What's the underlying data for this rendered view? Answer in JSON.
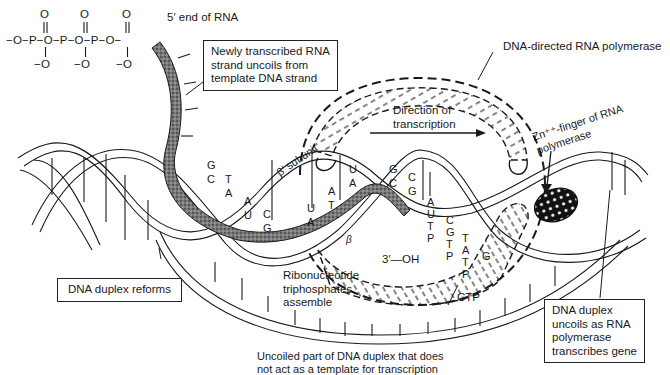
{
  "phosphate_chain": {
    "top_oxygens": [
      "O",
      "O",
      "O"
    ],
    "main_line": "−O−P−O−P−O−P−O−",
    "bottom_oxygens": [
      "−O",
      "−O",
      "−O"
    ]
  },
  "labels": {
    "five_prime_end": "5′ end of RNA",
    "newly_transcribed": [
      "Newly transcribed RNA",
      "strand uncoils from",
      "template DNA strand"
    ],
    "polymerase": "DNA-directed RNA polymerase",
    "direction": [
      "Direction of",
      "transcription"
    ],
    "beta_prime": "β′ subunit",
    "beta": "β",
    "zn_finger": [
      "Zn⁺⁺-finger of RNA",
      "polymerase"
    ],
    "three_prime_oh": "3′—OH",
    "ctp": "CTP",
    "ribonucleotide": [
      "Ribonucleotide",
      "triphosphates",
      "assemble"
    ],
    "duplex_reforms": "DNA duplex reforms",
    "duplex_uncoils": [
      "DNA duplex",
      "uncoils as RNA",
      "polymerase",
      "transcribes gene"
    ],
    "uncoiled_part": [
      "Uncoiled part of DNA duplex that does",
      "not act as a template for transcription"
    ]
  },
  "base_pairs": [
    {
      "top": "G",
      "bottom": "C"
    },
    {
      "top": "T",
      "bottom": "A"
    },
    {
      "top": "A",
      "bottom": "U"
    },
    {
      "top": "C",
      "bottom": "G"
    },
    {
      "top": "U",
      "bottom": "A"
    },
    {
      "top": "A",
      "bottom": "T"
    },
    {
      "top": "U",
      "bottom": "A"
    },
    {
      "top": "G",
      "bottom": "C"
    },
    {
      "top": "C",
      "bottom": "G"
    }
  ],
  "incoming_nucleotides": [
    {
      "letters": [
        "A",
        "U",
        "T",
        "P"
      ]
    },
    {
      "letters": [
        "C",
        "G",
        "T",
        "P"
      ]
    },
    {
      "letters": [
        "T",
        "A",
        "T",
        "P"
      ]
    },
    {
      "letters": [
        "G"
      ]
    }
  ],
  "colors": {
    "ink": "#1a1a1a",
    "background": "#ffffff",
    "rna_strand_fill": "#6a6a6a"
  }
}
